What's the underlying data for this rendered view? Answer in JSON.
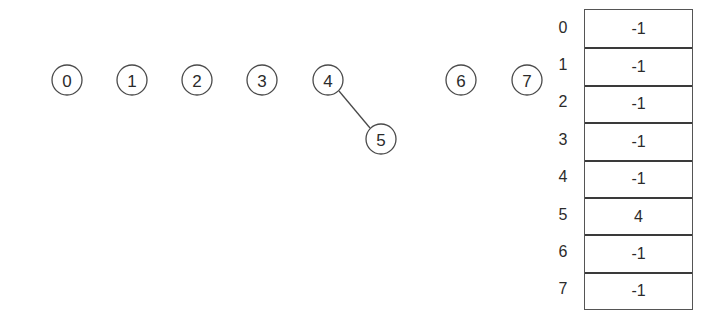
{
  "diagram": {
    "nodes": [
      {
        "id": "0",
        "label": "0",
        "cx": 67,
        "cy": 80,
        "r": 15
      },
      {
        "id": "1",
        "label": "1",
        "cx": 132,
        "cy": 80,
        "r": 15
      },
      {
        "id": "2",
        "label": "2",
        "cx": 197,
        "cy": 80,
        "r": 15
      },
      {
        "id": "3",
        "label": "3",
        "cx": 262,
        "cy": 80,
        "r": 15
      },
      {
        "id": "4",
        "label": "4",
        "cx": 328,
        "cy": 80,
        "r": 15
      },
      {
        "id": "5",
        "label": "5",
        "cx": 381,
        "cy": 139,
        "r": 15
      },
      {
        "id": "6",
        "label": "6",
        "cx": 461,
        "cy": 80,
        "r": 15
      },
      {
        "id": "7",
        "label": "7",
        "cx": 527,
        "cy": 80,
        "r": 15
      }
    ],
    "edges": [
      {
        "from": "4",
        "to": "5"
      }
    ]
  },
  "parent_array": {
    "indices": [
      "0",
      "1",
      "2",
      "3",
      "4",
      "5",
      "6",
      "7"
    ],
    "values": [
      "-1",
      "-1",
      "-1",
      "-1",
      "-1",
      "4",
      "-1",
      "-1"
    ]
  }
}
